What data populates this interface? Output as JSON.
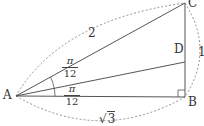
{
  "diagram": {
    "type": "geometry-triangle",
    "points": {
      "A": {
        "label": "A",
        "x": 16,
        "y": 96
      },
      "B": {
        "label": "B",
        "x": 185,
        "y": 97
      },
      "C": {
        "label": "C",
        "x": 185,
        "y": 3
      },
      "D": {
        "label": "D",
        "x": 185,
        "y": 62
      }
    },
    "segments": [
      "AB",
      "BC",
      "CA",
      "AD"
    ],
    "right_angle_at": "B",
    "lengths": {
      "AC": "2",
      "BC": "1",
      "AB_sqrt": "3"
    },
    "angles": {
      "CAD": {
        "numerator": "π",
        "denominator": "12"
      },
      "DAB": {
        "numerator": "π",
        "denominator": "12"
      }
    },
    "colors": {
      "line": "#555555",
      "dashed": "#777777",
      "text": "#333333"
    }
  }
}
